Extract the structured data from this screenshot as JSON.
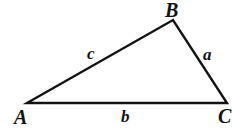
{
  "figure": {
    "kind": "triangle-diagram",
    "width": 242,
    "height": 134,
    "background_color": "#ffffff",
    "stroke_color": "#121212",
    "text_color": "#121212",
    "stroke_width": 2.4
  },
  "vertices": [
    {
      "id": "A",
      "label": "A",
      "x": 27,
      "y": 103
    },
    {
      "id": "B",
      "label": "B",
      "x": 173,
      "y": 20
    },
    {
      "id": "C",
      "label": "C",
      "x": 227,
      "y": 103
    }
  ],
  "sides": [
    {
      "id": "a",
      "label": "a",
      "from": "B",
      "to": "C",
      "label_x": 209,
      "label_y": 54
    },
    {
      "id": "b",
      "label": "b",
      "from": "A",
      "to": "C",
      "label_x": 126,
      "label_y": 117
    },
    {
      "id": "c",
      "label": "c",
      "from": "A",
      "to": "B",
      "label_x": 93,
      "label_y": 54
    }
  ],
  "chart_data": {
    "type": "diagram",
    "title": "",
    "shape": "scalene triangle",
    "points": {
      "A": [
        27,
        103
      ],
      "B": [
        173,
        20
      ],
      "C": [
        227,
        103
      ]
    },
    "edge_labels": {
      "AB": "c",
      "BC": "a",
      "AC": "b"
    },
    "vertex_labels": [
      "A",
      "B",
      "C"
    ],
    "annotations": [
      "A",
      "B",
      "C",
      "a",
      "b",
      "c"
    ]
  }
}
